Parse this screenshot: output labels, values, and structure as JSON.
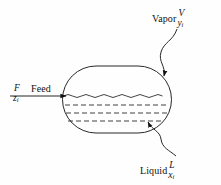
{
  "figure": {
    "type": "process-flow-diagram",
    "background_color": "#fefefe",
    "line_color": "#111111"
  },
  "streams": {
    "feed": {
      "label": "Feed",
      "flow_symbol": "F",
      "composition_symbol": "z",
      "composition_subscript": "i",
      "direction": "into-vessel-left"
    },
    "vapor": {
      "label": "Vapor",
      "flow_symbol": "V",
      "composition_symbol": "y",
      "composition_subscript": "i",
      "direction": "pointer-to-vapor-space"
    },
    "liquid": {
      "label": "Liquid",
      "flow_symbol": "L",
      "composition_symbol": "x",
      "composition_subscript": "i",
      "direction": "pointer-to-liquid-pool"
    }
  },
  "vessel": {
    "shape": "stadium",
    "surface_line_style": "wavy",
    "liquid_fill_lines": 3,
    "liquid_fill_style": "dashed"
  }
}
